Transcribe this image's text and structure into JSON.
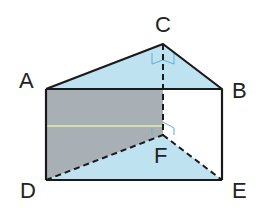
{
  "diagram": {
    "type": "triangular prism",
    "vertices": {
      "A": {
        "label": "A",
        "x": 46,
        "y": 89
      },
      "B": {
        "label": "B",
        "x": 222,
        "y": 89
      },
      "C": {
        "label": "C",
        "x": 163,
        "y": 44
      },
      "D": {
        "label": "D",
        "x": 46,
        "y": 180
      },
      "E": {
        "label": "E",
        "x": 222,
        "y": 180
      },
      "F": {
        "label": "F",
        "x": 163,
        "y": 135
      }
    },
    "colors": {
      "top_face": "#bfe2f1",
      "bottom_face": "#bfe2f1",
      "shaded_face": "#a9b0b5",
      "edge": "#1a1a1a",
      "right_angle_marker": "#5fb1cf",
      "highlight_line": "#e6f0a0"
    },
    "hidden_edges": [
      "CF",
      "DF",
      "FE"
    ],
    "right_angles": [
      "C",
      "F"
    ]
  }
}
